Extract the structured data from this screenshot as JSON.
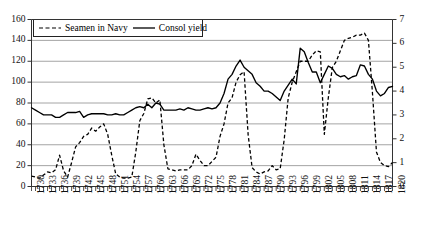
{
  "chart_data": {
    "type": "line",
    "title": "",
    "xlabel": "",
    "ylabel": "Seamen in Navy (thousands)",
    "ylabel_right": "Consol yield (%)",
    "xlim": [
      1730,
      1820
    ],
    "ylim": [
      0,
      160
    ],
    "ylim_right": [
      0,
      7
    ],
    "y_ticks": [
      0,
      20,
      40,
      60,
      80,
      100,
      120,
      140,
      160
    ],
    "y_ticks_right": [
      0,
      1,
      2,
      3,
      4,
      5,
      6,
      7
    ],
    "grid": true,
    "legend_position": "top-left",
    "x_tick_labels": [
      "1730",
      "1733",
      "1736",
      "1739",
      "1742",
      "1745",
      "1748",
      "1751",
      "1754",
      "1757",
      "1760",
      "1763",
      "1766",
      "1769",
      "1772",
      "1775",
      "1778",
      "1781",
      "1784",
      "1787",
      "1790",
      "1793",
      "1796",
      "1799",
      "1802",
      "1805",
      "1808",
      "1811",
      "1814",
      "1817",
      "1820"
    ],
    "x_tick_step": 3,
    "x_minor_tick_step": 1,
    "series": [
      {
        "name": "Seamen in Navy",
        "axis": "left",
        "style": "dashed",
        "color": "#000000",
        "x": [
          1730,
          1731,
          1732,
          1733,
          1734,
          1735,
          1736,
          1737,
          1738,
          1739,
          1740,
          1741,
          1742,
          1743,
          1744,
          1745,
          1746,
          1747,
          1748,
          1749,
          1750,
          1751,
          1752,
          1753,
          1754,
          1755,
          1756,
          1757,
          1758,
          1759,
          1760,
          1761,
          1762,
          1763,
          1764,
          1765,
          1766,
          1767,
          1768,
          1769,
          1770,
          1771,
          1772,
          1773,
          1774,
          1775,
          1776,
          1777,
          1778,
          1779,
          1780,
          1781,
          1782,
          1783,
          1784,
          1785,
          1786,
          1787,
          1788,
          1789,
          1790,
          1791,
          1792,
          1793,
          1794,
          1795,
          1796,
          1797,
          1798,
          1799,
          1800,
          1801,
          1802,
          1803,
          1804,
          1805,
          1806,
          1807,
          1808,
          1809,
          1810,
          1811,
          1812,
          1813,
          1814,
          1815,
          1816,
          1817,
          1818,
          1819,
          1820
        ],
        "values": [
          10,
          9,
          8,
          11,
          14,
          13,
          16,
          30,
          15,
          9,
          23,
          38,
          42,
          48,
          50,
          56,
          53,
          57,
          60,
          50,
          30,
          12,
          9,
          8,
          8,
          9,
          33,
          63,
          70,
          84,
          85,
          80,
          83,
          40,
          17,
          16,
          15,
          16,
          16,
          16,
          20,
          31,
          25,
          20,
          20,
          24,
          28,
          48,
          60,
          80,
          85,
          100,
          107,
          110,
          50,
          18,
          14,
          12,
          14,
          15,
          20,
          16,
          17,
          45,
          85,
          100,
          110,
          120,
          120,
          120,
          126,
          130,
          129,
          50,
          85,
          114,
          120,
          130,
          140,
          142,
          143,
          145,
          145,
          147,
          140,
          90,
          33,
          23,
          20,
          19,
          23
        ]
      },
      {
        "name": "Consol yield",
        "axis": "right",
        "style": "solid",
        "color": "#000000",
        "x": [
          1730,
          1731,
          1732,
          1733,
          1734,
          1735,
          1736,
          1737,
          1738,
          1739,
          1740,
          1741,
          1742,
          1743,
          1744,
          1745,
          1746,
          1747,
          1748,
          1749,
          1750,
          1751,
          1752,
          1753,
          1754,
          1755,
          1756,
          1757,
          1758,
          1759,
          1760,
          1761,
          1762,
          1763,
          1764,
          1765,
          1766,
          1767,
          1768,
          1769,
          1770,
          1771,
          1772,
          1773,
          1774,
          1775,
          1776,
          1777,
          1778,
          1779,
          1780,
          1781,
          1782,
          1783,
          1784,
          1785,
          1786,
          1787,
          1788,
          1789,
          1790,
          1791,
          1792,
          1793,
          1794,
          1795,
          1796,
          1797,
          1798,
          1799,
          1800,
          1801,
          1802,
          1803,
          1804,
          1805,
          1806,
          1807,
          1808,
          1809,
          1810,
          1811,
          1812,
          1813,
          1814,
          1815,
          1816,
          1817,
          1818,
          1819,
          1820
        ],
        "values": [
          3.3,
          3.2,
          3.1,
          3.0,
          3.0,
          3.0,
          2.9,
          2.9,
          3.0,
          3.1,
          3.1,
          3.1,
          3.15,
          2.9,
          3.0,
          3.05,
          3.05,
          3.05,
          3.05,
          3.0,
          3.0,
          3.05,
          3.0,
          3.0,
          3.1,
          3.2,
          3.3,
          3.35,
          3.3,
          3.45,
          3.3,
          3.5,
          3.45,
          3.2,
          3.2,
          3.2,
          3.2,
          3.25,
          3.2,
          3.3,
          3.25,
          3.2,
          3.2,
          3.25,
          3.3,
          3.25,
          3.3,
          3.5,
          3.9,
          4.5,
          4.7,
          5.05,
          5.3,
          5.0,
          4.85,
          4.7,
          4.35,
          4.2,
          4.0,
          4.0,
          3.9,
          3.75,
          3.6,
          4.0,
          4.25,
          4.5,
          4.3,
          5.8,
          5.65,
          5.2,
          4.8,
          4.8,
          4.35,
          4.7,
          5.05,
          4.95,
          4.7,
          4.6,
          4.65,
          4.5,
          4.6,
          4.65,
          5.1,
          5.05,
          4.7,
          4.5,
          4.0,
          3.8,
          3.9,
          4.15,
          4.2
        ]
      }
    ]
  },
  "legend": {
    "entries": [
      {
        "label": "Seamen in Navy",
        "style": "dashed"
      },
      {
        "label": "Consol yield",
        "style": "solid"
      }
    ]
  },
  "colors": {
    "line": "#000000",
    "grid": "#9a9a9a",
    "axis": "#333333",
    "background": "#ffffff"
  }
}
